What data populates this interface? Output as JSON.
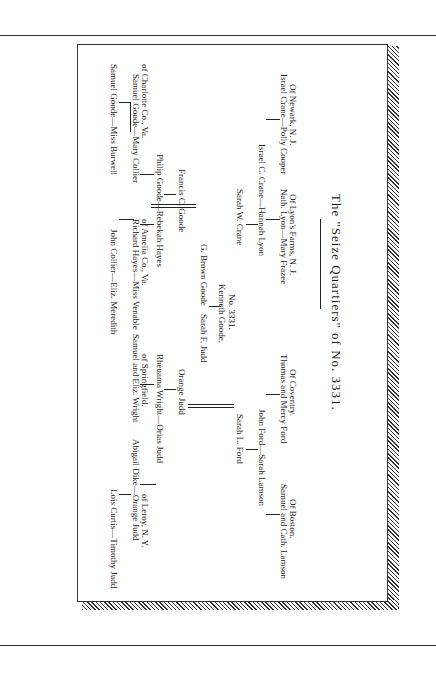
{
  "page": {
    "title_prefix": "The",
    "title_main": "\"Seize Quartiers\" of No. 3331.",
    "title_full": "The \"Seize Quartiers\" of No. 3331."
  },
  "chart": {
    "generation_1": [
      {
        "label": "Samuel Goode—Miss Burwell"
      },
      {
        "label": "John Collier—Eliz. Meredith"
      },
      {
        "label": "Lois Curtis—Timothy Judd"
      }
    ],
    "generation_2": [
      {
        "label": "Samuel Goode—Mary Collier",
        "sub": "of Charlotte Co., Va."
      },
      {
        "label": "Richard Hayes—Miss Venable",
        "sub": "of Amelia Co., Va."
      },
      {
        "label": "Samuel and Eliz. Wright",
        "sub": "of Springfield."
      },
      {
        "label": "Abigail Dike—Orange Judd",
        "sub": "of Leroy, N. Y."
      }
    ],
    "generation_3": [
      {
        "label": "Philip Goode—Rebekah Hayes"
      },
      {
        "label": "Rheuama Wright—Orias Judd"
      }
    ],
    "generation_4": [
      {
        "label": "Francis C. Goode"
      },
      {
        "label": "Orange Judd"
      }
    ],
    "generation_5": [
      {
        "label": "G. Brown Goode"
      },
      {
        "label": "Sarah F. Judd"
      }
    ],
    "subject": {
      "label": "Kenneth Goode,",
      "sub": "No. 3331."
    },
    "lower_generation_4": [
      {
        "label": "Sarah W. Crane"
      },
      {
        "label": "Sarah L. Ford"
      }
    ],
    "lower_generation_3": [
      {
        "label": "Israel C. Crane—Hannah Lyon"
      },
      {
        "label": "John Ford—Sarah Lamson"
      }
    ],
    "lower_generation_2": [
      {
        "label": "Israel Crane—Polly Cooper",
        "sub": "Of Newark, N. J."
      },
      {
        "label": "Nath. Lyon—Mary Frazee",
        "sub": "Of Lyon's Farms, N. J."
      },
      {
        "label": "Thomas and Mercy Ford",
        "sub": "Of Coventry."
      },
      {
        "label": "Samuel and Cath. Lamson",
        "sub": "Of Boston."
      }
    ]
  }
}
